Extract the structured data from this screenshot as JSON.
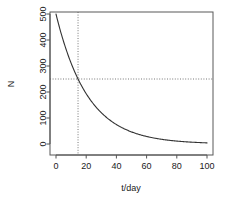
{
  "chart_data": {
    "type": "line",
    "title": "",
    "xlabel": "t/day",
    "ylabel": "N",
    "xlim": [
      0,
      100
    ],
    "ylim": [
      0,
      500
    ],
    "grid": false,
    "legend": "none",
    "xticks": [
      0,
      20,
      40,
      60,
      80,
      100
    ],
    "xtick_labels": [
      "0",
      "20",
      "40",
      "60",
      "80",
      "100"
    ],
    "yticks": [
      0,
      100,
      200,
      300,
      400,
      500
    ],
    "ytick_labels": [
      "0",
      "100",
      "200",
      "300",
      "400",
      "500"
    ],
    "series": [
      {
        "name": "N(t)",
        "style": "solid",
        "color": "#333333",
        "model": "exponential decay",
        "N0": 500,
        "half_life": 14.6,
        "lambda": 0.04747,
        "x": [
          0,
          2,
          4,
          6,
          8,
          10,
          12,
          14,
          14.6,
          16,
          18,
          20,
          25,
          30,
          35,
          40,
          45,
          50,
          55,
          60,
          65,
          70,
          75,
          80,
          85,
          90,
          95,
          100
        ],
        "y": [
          500,
          455,
          414,
          376,
          342,
          311,
          283,
          257,
          250,
          234,
          213,
          194,
          153,
          120,
          95,
          75,
          59,
          47,
          37,
          29,
          23,
          18,
          14,
          11,
          9,
          7,
          5,
          4
        ]
      }
    ],
    "annotations": [
      {
        "name": "half-value-horizontal-guide",
        "type": "hline",
        "value": 250,
        "style": "dotted",
        "color": "#777777"
      },
      {
        "name": "half-life-vertical-guide",
        "type": "vline",
        "value": 14.6,
        "style": "dotted",
        "color": "#777777"
      }
    ],
    "box_color": "#555555"
  }
}
